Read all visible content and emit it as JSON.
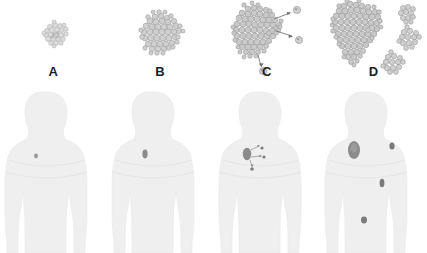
{
  "figure": {
    "background_color": "#ffffff",
    "panel_count": 4
  },
  "palette": {
    "label_color": "#1d1d1d",
    "cell_fill": "#c9c9c9",
    "cell_fill_light": "#dcdcdc",
    "cell_stroke": "#8f8f8f",
    "cell_stroke_light": "#a8a8a8",
    "body_fill": "#efefef",
    "body_stroke": "#e4e4e4",
    "tumor_marker": "#8b8b8b",
    "tumor_marker_dark": "#6e6e6e",
    "arrow_color": "#707070"
  },
  "panels": [
    {
      "id": "panel-a",
      "label": "A",
      "stage_name": "hyperplasia",
      "primary_tumor": {
        "size": "small",
        "cell_count": 24,
        "radius_px": 13,
        "shade": "light",
        "center_x": 58,
        "center_y": 34
      },
      "escaping_cells": 0,
      "metastatic_colonies": 0,
      "arrows": 0,
      "body": {
        "markers": [
          {
            "name": "primary-site",
            "x": 36,
            "y": 68,
            "rx": 2.0,
            "ry": 2.4,
            "shade": "#9a9a9a"
          }
        ],
        "marker_count": 1
      }
    },
    {
      "id": "panel-b",
      "label": "B",
      "stage_name": "dysplasia",
      "primary_tumor": {
        "size": "medium",
        "cell_count": 52,
        "radius_px": 21,
        "shade": "medium",
        "center_x": 54,
        "center_y": 36
      },
      "escaping_cells": 0,
      "metastatic_colonies": 0,
      "arrows": 0,
      "body": {
        "markers": [
          {
            "name": "primary-site",
            "x": 38,
            "y": 66,
            "rx": 2.6,
            "ry": 4.4,
            "shade": "#8b8b8b"
          }
        ],
        "marker_count": 1
      }
    },
    {
      "id": "panel-c",
      "label": "C",
      "stage_name": "invasive carcinoma",
      "primary_tumor": {
        "size": "large-irregular",
        "cell_count": 74,
        "radius_px": 25,
        "shade": "medium",
        "center_x": 44,
        "center_y": 34
      },
      "escaping_cells": 3,
      "metastatic_colonies": 0,
      "arrows": 3,
      "body": {
        "markers": [
          {
            "name": "primary-site",
            "x": 33,
            "y": 66,
            "rx": 4.2,
            "ry": 6.2,
            "shade": "#8b8b8b"
          },
          {
            "name": "escaping-cell-1",
            "x": 48,
            "y": 60,
            "rx": 1.6,
            "ry": 1.6,
            "shade": "#7d7d7d"
          },
          {
            "name": "escaping-cell-2",
            "x": 50,
            "y": 69,
            "rx": 1.6,
            "ry": 1.6,
            "shade": "#7d7d7d"
          },
          {
            "name": "escaping-cell-3",
            "x": 38,
            "y": 81,
            "rx": 1.8,
            "ry": 1.8,
            "shade": "#7d7d7d"
          }
        ],
        "marker_count": 4,
        "arrow_count": 3
      }
    },
    {
      "id": "panel-d",
      "label": "D",
      "stage_name": "metastasis",
      "primary_tumor": {
        "size": "very-large",
        "cell_count": 110,
        "radius_px": 30,
        "shade": "medium",
        "center_x": 40,
        "center_y": 34
      },
      "escaping_cells": 0,
      "metastatic_colonies": 3,
      "colonies": [
        {
          "name": "colony-1",
          "x": 86,
          "y": 15,
          "r": 9,
          "cell_count": 11
        },
        {
          "name": "colony-2",
          "x": 90,
          "y": 41,
          "r": 11,
          "cell_count": 14
        },
        {
          "name": "colony-3",
          "x": 74,
          "y": 66,
          "r": 11,
          "cell_count": 14
        }
      ],
      "arrows": 0,
      "body": {
        "markers": [
          {
            "name": "primary-site",
            "x": 34,
            "y": 62,
            "rx": 6.0,
            "ry": 9.0,
            "shade": "#8b8b8b"
          },
          {
            "name": "metastasis-shoulder",
            "x": 72,
            "y": 58,
            "rx": 2.6,
            "ry": 3.6,
            "shade": "#7a7a7a"
          },
          {
            "name": "metastasis-abdomen",
            "x": 62,
            "y": 95,
            "rx": 2.4,
            "ry": 4.2,
            "shade": "#7a7a7a"
          },
          {
            "name": "metastasis-pelvis",
            "x": 44,
            "y": 132,
            "rx": 3.0,
            "ry": 3.4,
            "shade": "#7a7a7a"
          }
        ],
        "marker_count": 4
      }
    }
  ]
}
